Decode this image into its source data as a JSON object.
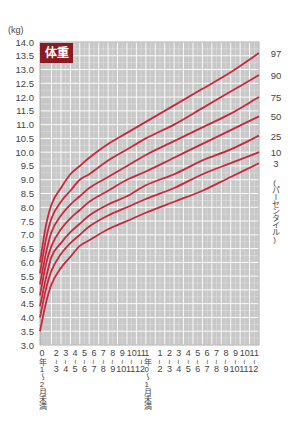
{
  "chart_data": {
    "type": "line",
    "title": "体重",
    "ylabel": "(kg)",
    "xlabel": "月齢 (0〜2年)",
    "ylim": [
      3.0,
      14.0
    ],
    "xlim": [
      0,
      24
    ],
    "y_ticks": [
      "3.0",
      "3.5",
      "4.0",
      "4.5",
      "5.0",
      "5.5",
      "6.0",
      "6.5",
      "7.0",
      "7.5",
      "8.0",
      "8.5",
      "9.0",
      "9.5",
      "10.0",
      "10.5",
      "11.0",
      "11.5",
      "12.0",
      "12.5",
      "13.0",
      "13.5",
      "14.0"
    ],
    "x_tick_labels": [
      {
        "top": "0",
        "bottom": "年1〜2月未満"
      },
      {
        "top": "2",
        "bottom": "3"
      },
      {
        "top": "3",
        "bottom": "4"
      },
      {
        "top": "4",
        "bottom": "5"
      },
      {
        "top": "5",
        "bottom": "6"
      },
      {
        "top": "6",
        "bottom": "7"
      },
      {
        "top": "7",
        "bottom": "8"
      },
      {
        "top": "8",
        "bottom": "9"
      },
      {
        "top": "9",
        "bottom": "10"
      },
      {
        "top": "10",
        "bottom": "11"
      },
      {
        "top": "11",
        "bottom": "12"
      },
      {
        "top": "1",
        "bottom": "年0〜1月未満"
      },
      {
        "top": "1",
        "bottom": "2"
      },
      {
        "top": "2",
        "bottom": "3"
      },
      {
        "top": "3",
        "bottom": "4"
      },
      {
        "top": "4",
        "bottom": "5"
      },
      {
        "top": "5",
        "bottom": "6"
      },
      {
        "top": "6",
        "bottom": "7"
      },
      {
        "top": "7",
        "bottom": "8"
      },
      {
        "top": "8",
        "bottom": "9"
      },
      {
        "top": "9",
        "bottom": "10"
      },
      {
        "top": "10",
        "bottom": "11"
      },
      {
        "top": "11",
        "bottom": "12"
      }
    ],
    "x": [
      0,
      1,
      2,
      3,
      4,
      5,
      6,
      8,
      10,
      12,
      15,
      18,
      21,
      24
    ],
    "series": [
      {
        "name": "97",
        "values": [
          6.0,
          7.3,
          8.1,
          8.7,
          9.2,
          9.5,
          9.8,
          10.3,
          10.7,
          11.1,
          11.7,
          12.3,
          12.9,
          13.6
        ]
      },
      {
        "name": "90",
        "values": [
          5.6,
          6.8,
          7.6,
          8.2,
          8.6,
          9.0,
          9.2,
          9.7,
          10.1,
          10.5,
          11.0,
          11.6,
          12.2,
          12.8
        ]
      },
      {
        "name": "75",
        "values": [
          5.2,
          6.3,
          7.1,
          7.7,
          8.1,
          8.4,
          8.7,
          9.1,
          9.5,
          9.9,
          10.4,
          10.9,
          11.4,
          12.0
        ]
      },
      {
        "name": "50",
        "values": [
          4.8,
          5.9,
          6.6,
          7.2,
          7.6,
          7.9,
          8.2,
          8.6,
          9.0,
          9.3,
          9.8,
          10.3,
          10.8,
          11.3
        ]
      },
      {
        "name": "25",
        "values": [
          4.4,
          5.4,
          6.2,
          6.7,
          7.1,
          7.4,
          7.7,
          8.1,
          8.4,
          8.8,
          9.2,
          9.7,
          10.1,
          10.6
        ]
      },
      {
        "name": "10",
        "values": [
          4.0,
          5.0,
          5.7,
          6.3,
          6.7,
          7.0,
          7.3,
          7.7,
          8.0,
          8.3,
          8.7,
          9.2,
          9.6,
          10.0
        ]
      },
      {
        "name": "3",
        "values": [
          3.5,
          4.5,
          5.2,
          5.8,
          6.2,
          6.6,
          6.8,
          7.2,
          7.5,
          7.8,
          8.2,
          8.6,
          9.1,
          9.6
        ]
      }
    ],
    "legend_label": "(パーセンタイル)",
    "legend_position": "right",
    "grid": true,
    "colors": {
      "curve": "#c8283c",
      "grid_bg": "#c8c8c8",
      "grid_line": "#ffffff",
      "title_bg": "#8b1a22",
      "title_text": "#ffffff"
    }
  }
}
